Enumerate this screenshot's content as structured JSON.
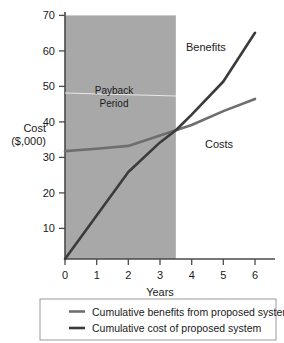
{
  "chart_data": {
    "type": "line",
    "title": "",
    "xlabel": "Years",
    "ylabel_line1": "Cost",
    "ylabel_line2": "($,000)",
    "xlim": [
      0,
      6.3
    ],
    "ylim": [
      0,
      70
    ],
    "xticks": [
      "0",
      "1",
      "2",
      "3",
      "4",
      "5",
      "6"
    ],
    "xtick_values": [
      0,
      1,
      2,
      3,
      4,
      5,
      6
    ],
    "yticks": [
      "10",
      "20",
      "30",
      "40",
      "50",
      "60",
      "70"
    ],
    "ytick_values": [
      10,
      20,
      30,
      40,
      50,
      60,
      70
    ],
    "grid": false,
    "legend_position": "below-figure",
    "x": [
      0,
      1,
      2,
      3,
      3.5,
      4,
      5,
      6
    ],
    "series": [
      {
        "name": "Cumulative benefits from proposed system",
        "color": "#3b3b3b",
        "label_on_plot": "Benefits",
        "values": [
          0,
          12.5,
          25,
          33.5,
          37,
          41.5,
          51,
          65
        ]
      },
      {
        "name": "Cumulative cost of proposed system",
        "color": "#6e6e6e",
        "label_on_plot": "Costs",
        "values": [
          31,
          31.7,
          32.5,
          35.5,
          37,
          38.5,
          42.5,
          46
        ]
      }
    ],
    "annotations": [
      {
        "name": "payback-period",
        "text_line1": "Payback",
        "text_line2": "Period",
        "span_x": [
          0,
          3.5
        ],
        "marker_y": 46.5,
        "color": "#e8e8e8"
      }
    ],
    "shaded_region": {
      "name": "payback-shading",
      "x_from": 0,
      "x_to": 3.5,
      "y_from": 0,
      "y_to": 70,
      "color": "#a8a8a8"
    },
    "axis_color": "#4a4a4a"
  },
  "legend": {
    "items": [
      {
        "label": "Cumulative benefits from proposed system",
        "color": "#6e6e6e"
      },
      {
        "label": "Cumulative cost of proposed system",
        "color": "#3b3b3b"
      }
    ],
    "border_color": "#9a9a9a"
  }
}
